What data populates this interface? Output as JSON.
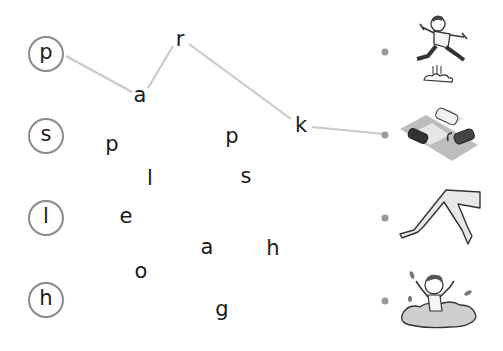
{
  "worksheet": {
    "start_letters": [
      {
        "letter": "p",
        "x": 46,
        "y": 54
      },
      {
        "letter": "s",
        "x": 46,
        "y": 136
      },
      {
        "letter": "l",
        "x": 46,
        "y": 218
      },
      {
        "letter": "h",
        "x": 46,
        "y": 300
      }
    ],
    "scattered_letters": [
      {
        "letter": "r",
        "x": 180,
        "y": 42
      },
      {
        "letter": "a",
        "x": 140,
        "y": 98
      },
      {
        "letter": "k",
        "x": 301,
        "y": 128
      },
      {
        "letter": "p",
        "x": 112,
        "y": 147
      },
      {
        "letter": "p",
        "x": 232,
        "y": 139
      },
      {
        "letter": "l",
        "x": 150,
        "y": 181
      },
      {
        "letter": "s",
        "x": 246,
        "y": 179
      },
      {
        "letter": "e",
        "x": 126,
        "y": 219
      },
      {
        "letter": "a",
        "x": 207,
        "y": 250
      },
      {
        "letter": "h",
        "x": 273,
        "y": 251
      },
      {
        "letter": "o",
        "x": 141,
        "y": 274
      },
      {
        "letter": "g",
        "x": 222,
        "y": 312
      }
    ],
    "connector_lines": [
      {
        "x1": 66,
        "y1": 56,
        "x2": 132,
        "y2": 92
      },
      {
        "x1": 148,
        "y1": 88,
        "x2": 173,
        "y2": 46
      },
      {
        "x1": 189,
        "y1": 44,
        "x2": 291,
        "y2": 119
      },
      {
        "x1": 312,
        "y1": 127,
        "x2": 384,
        "y2": 134
      }
    ],
    "answer_dots": [
      {
        "x": 385,
        "y": 52
      },
      {
        "x": 385,
        "y": 135
      },
      {
        "x": 385,
        "y": 218
      },
      {
        "x": 385,
        "y": 301
      }
    ],
    "pictures": [
      {
        "name": "jumping-boy",
        "word": "jump"
      },
      {
        "name": "parking-cars",
        "word": "park"
      },
      {
        "name": "legs",
        "word": "legs"
      },
      {
        "name": "splashing-boy",
        "word": "splash"
      }
    ],
    "colors": {
      "line": "#c8c8c8",
      "circle_border": "#8a8a8a",
      "dot": "#999999",
      "text": "#1a1a1a"
    }
  }
}
